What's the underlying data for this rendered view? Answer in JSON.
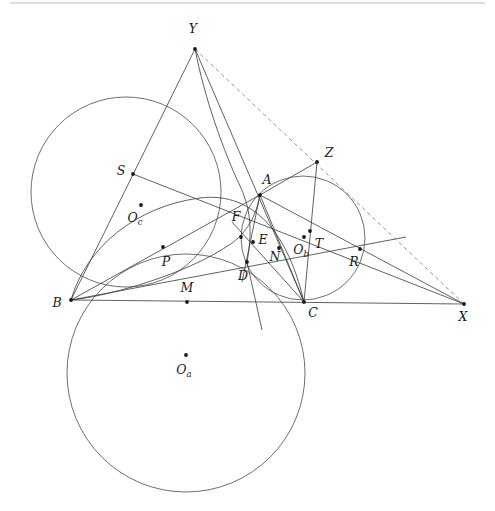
{
  "figure": {
    "width": 495,
    "height": 511,
    "background_color": "#ffffff",
    "line_color": "#3a3a3a",
    "dashed_line_color": "#8a8a8a",
    "point_color": "#1a1a1a",
    "top_rule_color": "#bfbfbf"
  },
  "points": [
    {
      "id": "Y",
      "label": "Y",
      "x": 195,
      "y": 49,
      "lx": 193,
      "ly": 33,
      "anchor": "middle",
      "dot": true
    },
    {
      "id": "S",
      "label": "S",
      "x": 133,
      "y": 174,
      "lx": 121,
      "ly": 175,
      "anchor": "middle",
      "dot": true
    },
    {
      "id": "A",
      "label": "A",
      "x": 260,
      "y": 195,
      "lx": 267,
      "ly": 184,
      "anchor": "middle",
      "dot": true
    },
    {
      "id": "Z",
      "label": "Z",
      "x": 317,
      "y": 162,
      "lx": 329,
      "ly": 157,
      "anchor": "middle",
      "dot": true
    },
    {
      "id": "Oc",
      "label": "O",
      "sub": "c",
      "x": 141,
      "y": 205,
      "lx": 135,
      "ly": 222,
      "anchor": "middle",
      "dot": true
    },
    {
      "id": "F",
      "label": "F",
      "x": 241,
      "y": 237,
      "lx": 236,
      "ly": 221,
      "anchor": "middle",
      "dot": true
    },
    {
      "id": "E",
      "label": "E",
      "x": 253,
      "y": 242,
      "lx": 263,
      "ly": 244,
      "anchor": "middle",
      "dot": true
    },
    {
      "id": "Ob",
      "label": "O",
      "sub": "b",
      "x": 304,
      "y": 237,
      "lx": 301,
      "ly": 254,
      "anchor": "middle",
      "dot": true
    },
    {
      "id": "T",
      "label": "T",
      "x": 310,
      "y": 231,
      "lx": 319,
      "ly": 248,
      "anchor": "middle",
      "dot": true
    },
    {
      "id": "R",
      "label": "R",
      "x": 360,
      "y": 249,
      "lx": 354,
      "ly": 266,
      "anchor": "middle",
      "dot": true
    },
    {
      "id": "P",
      "label": "P",
      "x": 163,
      "y": 247,
      "lx": 166,
      "ly": 266,
      "anchor": "middle",
      "dot": true
    },
    {
      "id": "N",
      "label": "N",
      "x": 279,
      "y": 248,
      "lx": 275,
      "ly": 261,
      "anchor": "middle",
      "dot": true
    },
    {
      "id": "D",
      "label": "D",
      "x": 247,
      "y": 262,
      "lx": 243,
      "ly": 280,
      "anchor": "middle",
      "dot": true
    },
    {
      "id": "M",
      "label": "M",
      "x": 187,
      "y": 302,
      "lx": 187,
      "ly": 292,
      "anchor": "middle",
      "dot": true
    },
    {
      "id": "B",
      "label": "B",
      "x": 71,
      "y": 300,
      "lx": 57,
      "ly": 307,
      "anchor": "middle",
      "dot": true
    },
    {
      "id": "C",
      "label": "C",
      "x": 304,
      "y": 302,
      "lx": 313,
      "ly": 317,
      "anchor": "middle",
      "dot": true
    },
    {
      "id": "X",
      "label": "X",
      "x": 464,
      "y": 304,
      "lx": 463,
      "ly": 321,
      "anchor": "middle",
      "dot": true
    },
    {
      "id": "Oa",
      "label": "O",
      "sub": "a",
      "x": 186,
      "y": 355,
      "lx": 184,
      "ly": 374,
      "anchor": "middle",
      "dot": true
    }
  ],
  "circles": [
    {
      "id": "circle-Oc",
      "name": "circle-oc",
      "cx": 126,
      "cy": 192,
      "r": 95,
      "style": "solid"
    },
    {
      "id": "circle-Oa",
      "name": "circle-oa",
      "cx": 186,
      "cy": 373,
      "r": 119,
      "style": "solid"
    },
    {
      "id": "circle-Ob",
      "name": "circle-ob",
      "cx": 303,
      "cy": 238,
      "r": 62,
      "style": "solid"
    }
  ],
  "arcs": [
    {
      "id": "arc-circumcircle",
      "name": "arc-circumcircle-abc",
      "d": "M 71 300 C 86 247 137 206 200 198 C 247 192 286 224 304 302",
      "style": "solid"
    },
    {
      "id": "arc-incircle-like",
      "name": "arc-incircle",
      "d": "M 71 300 C 110 296 190 273 232 243 C 251 229 257 210 260 195",
      "style": "solid"
    },
    {
      "id": "arc-mixtilinear",
      "name": "arc-mixtilinear",
      "d": "M 195 49 C 205 100 224 152 240 186 C 248 203 254 225 247 262",
      "style": "solid"
    }
  ],
  "segments": [
    {
      "id": "seg-Y-B",
      "name": "segment-y-b",
      "x1": 195,
      "y1": 49,
      "x2": 71,
      "y2": 300,
      "style": "solid"
    },
    {
      "id": "seg-Y-C",
      "name": "segment-y-c",
      "x1": 195,
      "y1": 49,
      "x2": 304,
      "y2": 302,
      "style": "solid"
    },
    {
      "id": "seg-B-C",
      "name": "segment-b-c",
      "x1": 71,
      "y1": 300,
      "x2": 464,
      "y2": 304,
      "style": "solid"
    },
    {
      "id": "seg-B-A",
      "name": "segment-b-a",
      "x1": 71,
      "y1": 300,
      "x2": 260,
      "y2": 195,
      "style": "solid"
    },
    {
      "id": "seg-B-R",
      "name": "segment-b-r-x",
      "x1": 71,
      "y1": 300,
      "x2": 464,
      "y2": 304,
      "style": "none"
    },
    {
      "id": "seg-S-X",
      "name": "segment-s-x",
      "x1": 133,
      "y1": 174,
      "x2": 464,
      "y2": 304,
      "style": "solid"
    },
    {
      "id": "seg-B-RX",
      "name": "segment-b-through-p-r",
      "x1": 71,
      "y1": 300,
      "x2": 406,
      "y2": 237,
      "style": "solid"
    },
    {
      "id": "seg-A-C",
      "name": "segment-a-c",
      "x1": 260,
      "y1": 195,
      "x2": 304,
      "y2": 302,
      "style": "solid"
    },
    {
      "id": "seg-A-X",
      "name": "segment-a-x",
      "x1": 260,
      "y1": 195,
      "x2": 464,
      "y2": 304,
      "style": "solid"
    },
    {
      "id": "seg-Z-A",
      "name": "segment-z-a",
      "x1": 317,
      "y1": 162,
      "x2": 260,
      "y2": 195,
      "style": "solid"
    },
    {
      "id": "seg-Z-C",
      "name": "segment-z-c",
      "x1": 317,
      "y1": 162,
      "x2": 304,
      "y2": 302,
      "style": "solid"
    },
    {
      "id": "seg-A-D",
      "name": "segment-a-d",
      "x1": 260,
      "y1": 195,
      "x2": 242,
      "y2": 282,
      "style": "solid"
    },
    {
      "id": "seg-C-F",
      "name": "segment-c-f",
      "x1": 304,
      "y1": 302,
      "x2": 232,
      "y2": 222,
      "style": "solid"
    },
    {
      "id": "seg-C-N",
      "name": "segment-c-n",
      "x1": 304,
      "y1": 302,
      "x2": 260,
      "y2": 195,
      "style": "none"
    },
    {
      "id": "seg-D-C",
      "name": "segment-d-to-lower",
      "x1": 247,
      "y1": 262,
      "x2": 262,
      "y2": 330,
      "style": "solid"
    }
  ],
  "dashed_segments": [
    {
      "id": "dash-Y-X",
      "name": "dashed-segment-y-z-x",
      "x1": 195,
      "y1": 49,
      "x2": 464,
      "y2": 304
    }
  ],
  "top_rule": {
    "name": "top-horizontal-rule",
    "x1": 10,
    "y1": 3,
    "x2": 485,
    "y2": 3
  }
}
